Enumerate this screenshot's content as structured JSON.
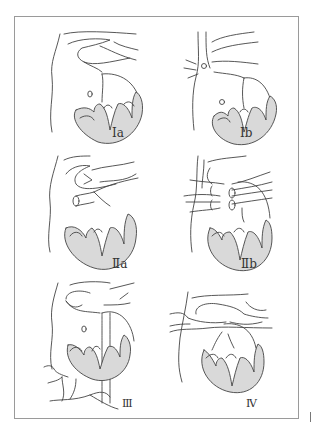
{
  "figure": {
    "colors": {
      "frame": "#9a9a9a",
      "line": "#444444",
      "myocardium_fill": "#d9d9d9",
      "background": "#ffffff"
    },
    "panels": [
      {
        "id": "Ia",
        "label": "Ⅰa",
        "row": 1,
        "col": 1
      },
      {
        "id": "Ib",
        "label": "Ⅰb",
        "row": 1,
        "col": 2
      },
      {
        "id": "IIa",
        "label": "Ⅱa",
        "row": 2,
        "col": 1
      },
      {
        "id": "IIb",
        "label": "Ⅱb",
        "row": 2,
        "col": 2
      },
      {
        "id": "III",
        "label": "Ⅲ",
        "row": 3,
        "col": 1
      },
      {
        "id": "IV",
        "label": "Ⅳ",
        "row": 3,
        "col": 2
      }
    ]
  }
}
